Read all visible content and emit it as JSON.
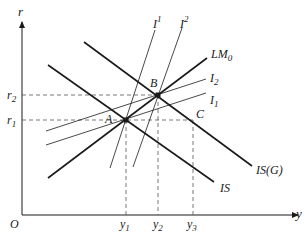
{
  "diagram": {
    "type": "IS-LM-investment",
    "axes": {
      "x_label": "y",
      "y_label": "r",
      "origin_label": "O",
      "x_ticks": [
        {
          "base": "y",
          "sub": "1"
        },
        {
          "base": "y",
          "sub": "2"
        },
        {
          "base": "y",
          "sub": "3"
        }
      ],
      "y_ticks": [
        {
          "base": "r",
          "sub": "2"
        },
        {
          "base": "r",
          "sub": "1"
        }
      ]
    },
    "curves": {
      "lm": {
        "base": "LM",
        "sub": "0"
      },
      "is": {
        "label": "IS"
      },
      "is_g": {
        "label": "IS(G)"
      },
      "i_sup1": {
        "base": "I",
        "sup": "1"
      },
      "i_sup2": {
        "base": "I",
        "sup": "2"
      },
      "i_sub2": {
        "base": "I",
        "sub": "2"
      },
      "i_sub1": {
        "base": "I",
        "sub": "1"
      }
    },
    "points": {
      "a": "A",
      "b": "B",
      "c": "C"
    },
    "colors": {
      "line": "#1a1a1a",
      "dashed": "#555555",
      "background": "#ffffff"
    }
  }
}
